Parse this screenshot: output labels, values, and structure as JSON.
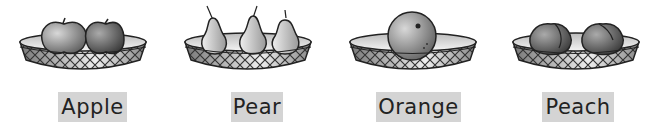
{
  "items": [
    {
      "label": "Apple",
      "fruit": "apple"
    },
    {
      "label": "Pear",
      "fruit": "pear"
    },
    {
      "label": "Orange",
      "fruit": "orange"
    },
    {
      "label": "Peach",
      "fruit": "peach"
    }
  ],
  "colors": {
    "label_bg": "#d4d4d4",
    "label_text": "#222222"
  }
}
